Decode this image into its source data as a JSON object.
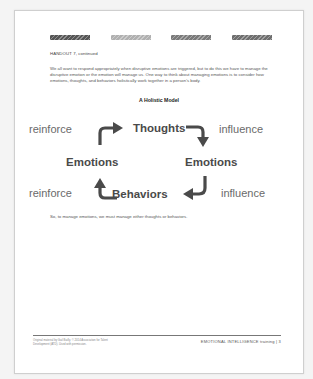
{
  "header": {
    "color_bars": [
      {
        "color": "#555555",
        "left": 0
      },
      {
        "color": "#b0b0b0",
        "left": 61
      },
      {
        "color": "#7a7a7a",
        "left": 121
      },
      {
        "color": "#6e6e6e",
        "left": 182
      }
    ],
    "handout_label": "HANDOUT 7, continued"
  },
  "body": {
    "intro": "We all want to respond appropriately when disruptive emotions are triggered, but to do this we have to manage the disruptive emotion or the emotion will manage us. One way to think about managing emotions is to consider how emotions, thoughts, and behaviors holistically work together in a person's body.",
    "model_title": "A Holistic Model",
    "conclusion": "So, to manage emotions, we must manage either thoughts or behaviors."
  },
  "diagram": {
    "nodes": {
      "top": "Thoughts",
      "left": "Emotions",
      "right": "Emotions",
      "bottom": "Behaviors"
    },
    "verbs": {
      "top_left": "reinforce",
      "top_right": "influence",
      "bottom_left": "reinforce",
      "bottom_right": "influence"
    },
    "arrow_color": "#4a4a4a"
  },
  "footer": {
    "left": "Original material by Gail Bailly. © 2014 Association for Talent Development (ATD). Used with permission.",
    "right": "EMOTIONAL INTELLIGENCE training  |  3"
  }
}
